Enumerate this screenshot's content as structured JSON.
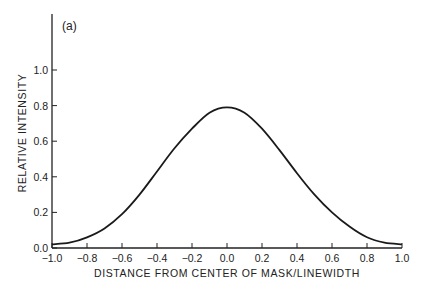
{
  "chart_data": {
    "type": "line",
    "title": "",
    "panel_label": "(a)",
    "xlabel": "DISTANCE FROM CENTER OF MASK/LINEWIDTH",
    "ylabel": "RELATIVE INTENSITY",
    "xlim": [
      -1.0,
      1.0
    ],
    "ylim": [
      0.0,
      1.2
    ],
    "x_ticks": [
      "-1.0",
      "-0.8",
      "-0.6",
      "-0.4",
      "-0.2",
      "0.0",
      "0.2",
      "0.4",
      "0.6",
      "0.8",
      "1.0"
    ],
    "y_ticks": [
      "0.0",
      "0.2",
      "0.4",
      "0.6",
      "0.8",
      "1.0"
    ],
    "grid": false,
    "legend": null,
    "series": [
      {
        "name": "relative intensity",
        "x": [
          -1.0,
          -0.9,
          -0.8,
          -0.7,
          -0.6,
          -0.5,
          -0.4,
          -0.3,
          -0.2,
          -0.1,
          0.0,
          0.1,
          0.2,
          0.3,
          0.4,
          0.5,
          0.6,
          0.7,
          0.8,
          0.9,
          1.0
        ],
        "y": [
          0.02,
          0.03,
          0.06,
          0.11,
          0.19,
          0.3,
          0.43,
          0.56,
          0.67,
          0.76,
          0.79,
          0.76,
          0.67,
          0.55,
          0.42,
          0.3,
          0.2,
          0.12,
          0.06,
          0.03,
          0.02
        ]
      }
    ]
  }
}
